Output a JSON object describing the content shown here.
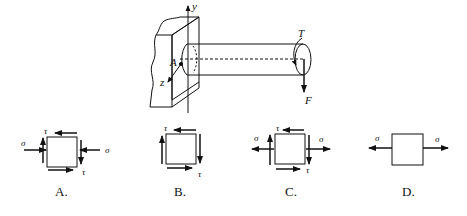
{
  "figure": {
    "main": {
      "axis_y_label": "y",
      "axis_z_label": "z",
      "point_label": "A",
      "torque_label": "T",
      "force_label": "F"
    },
    "options": [
      {
        "label": "A.",
        "normal_left": "σ",
        "normal_right": "σ",
        "shear_top": "τ",
        "shear_bottom": "τ",
        "normal_direction": "compression"
      },
      {
        "label": "B.",
        "shear_top": "τ",
        "shear_bottom": "τ"
      },
      {
        "label": "C.",
        "normal_left": "σ",
        "normal_right": "σ",
        "shear_top": "τ",
        "shear_bottom": "τ",
        "normal_direction": "tension"
      },
      {
        "label": "D.",
        "normal_left": "σ",
        "normal_right": "σ",
        "normal_direction": "tension"
      }
    ]
  },
  "colors": {
    "stroke": "#111111",
    "background": "#ffffff"
  }
}
